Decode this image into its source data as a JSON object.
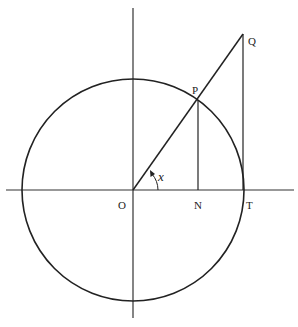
{
  "diagram": {
    "type": "unit-circle-trig",
    "labels": {
      "origin": "O",
      "point_on_circle": "P",
      "foot_of_perpendicular": "N",
      "tangent_point": "T",
      "tangent_intersection": "Q",
      "angle": "x"
    },
    "colors": {
      "stroke": "#222222",
      "background": "#ffffff"
    }
  }
}
